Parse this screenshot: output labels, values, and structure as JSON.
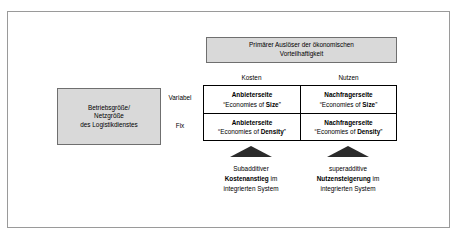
{
  "diagram": {
    "trigger_box": {
      "line1": "Primärer Auslöser der ökonomischen",
      "line2": "Vorteilhaftigkeit"
    },
    "subject_box": {
      "line1": "Betriebsgröße/",
      "line2": "Netzgröße",
      "line3": "des Logistikdienstes"
    },
    "column_headers": {
      "cost": "Kosten",
      "benefit": "Nutzen"
    },
    "row_labels": {
      "variable": "Variabel",
      "fixed": "Fix"
    },
    "matrix": {
      "cells": [
        {
          "title": "Anbieterseite",
          "sub_prefix": "“Economies of ",
          "sub_bold": "Size",
          "sub_suffix": "”"
        },
        {
          "title": "Nachfragerseite",
          "sub_prefix": "“Economies of ",
          "sub_bold": "Size",
          "sub_suffix": "”"
        },
        {
          "title": "Anbieterseite",
          "sub_prefix": "“Economies of ",
          "sub_bold": "Density",
          "sub_suffix": "”"
        },
        {
          "title": "Nachfragerseite",
          "sub_prefix": "“Economies of ",
          "sub_bold": "Density",
          "sub_suffix": "”"
        }
      ]
    },
    "captions": {
      "left": {
        "line1": "Subadditiver",
        "line2_bold": "Kostenanstieg",
        "line2_rest": " im",
        "line3": "integrierten System"
      },
      "right": {
        "line1": "superadditive",
        "line2_bold": "Nutzensteigerung",
        "line2_rest": " im",
        "line3": "integrierten System"
      }
    },
    "colors": {
      "box_fill": "#d9d9d9",
      "box_border": "#6f6f6f",
      "frame_border": "#9a9a9a",
      "matrix_border": "#000000",
      "arrow_fill": "#2b2b2b"
    }
  }
}
